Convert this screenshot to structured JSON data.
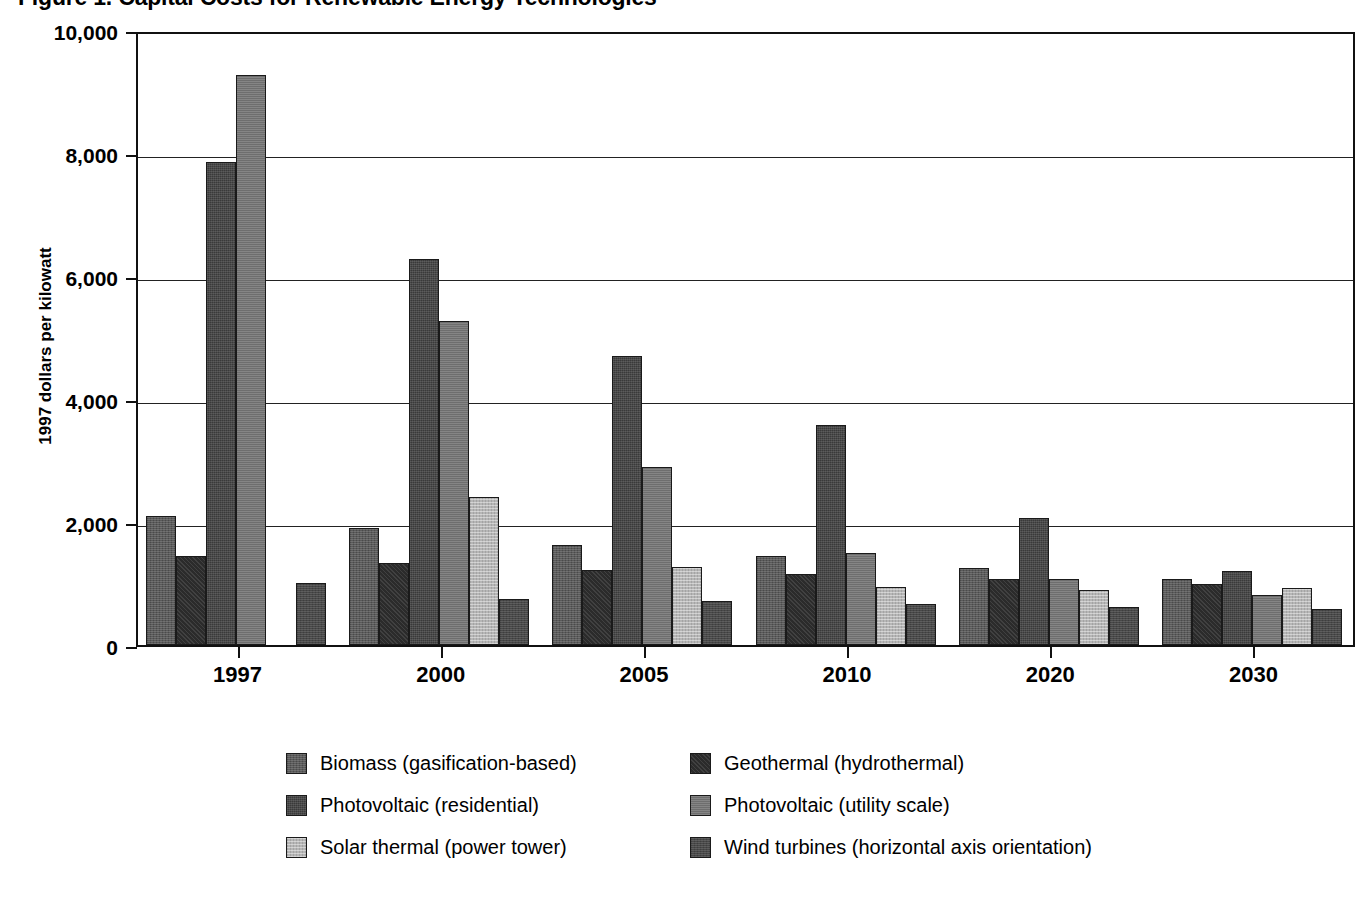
{
  "figure": {
    "title": "Figure 1.  Capital Costs for Renewable Energy Technologies",
    "y_axis_title": "1997 dollars per kilowatt"
  },
  "axis": {
    "y_ticks": [
      "10,000",
      "8,000",
      "6,000",
      "4,000",
      "2,000",
      "0"
    ],
    "x_ticks": [
      "1997",
      "2000",
      "2005",
      "2010",
      "2020",
      "2030"
    ]
  },
  "legend": {
    "items": [
      {
        "label": "Biomass (gasification-based)",
        "key": "biomass",
        "swatch": "#5a5a5a"
      },
      {
        "label": "Geothermal (hydrothermal)",
        "key": "geothermal",
        "swatch": "#2b2b2b"
      },
      {
        "label": "Photovoltaic (residential)",
        "key": "pv-res",
        "swatch": "#3a3a3a"
      },
      {
        "label": "Photovoltaic (utility scale)",
        "key": "pv-util",
        "swatch": "#6e6e6e"
      },
      {
        "label": "Solar thermal (power tower)",
        "key": "solar-thermal",
        "swatch": "#b6b6b6"
      },
      {
        "label": "Wind turbines (horizontal axis orientation)",
        "key": "wind",
        "swatch": "#484848"
      }
    ]
  },
  "chart_data": {
    "type": "bar",
    "title": "Figure 1.  Capital Costs for Renewable Energy Technologies",
    "xlabel": "",
    "ylabel": "1997 dollars per kilowatt",
    "ylim": [
      0,
      10000
    ],
    "ytick_values": [
      0,
      2000,
      4000,
      6000,
      8000,
      10000
    ],
    "grid": true,
    "legend_position": "bottom",
    "categories": [
      "1997",
      "2000",
      "2005",
      "2010",
      "2020",
      "2030"
    ],
    "series": [
      {
        "name": "Biomass (gasification-based)",
        "color": "#5a5a5a",
        "values": [
          2100,
          1900,
          1620,
          1440,
          1250,
          1070
        ]
      },
      {
        "name": "Geothermal (hydrothermal)",
        "color": "#2b2b2b",
        "values": [
          1440,
          1340,
          1220,
          1160,
          1070,
          990
        ]
      },
      {
        "name": "Photovoltaic (residential)",
        "color": "#3a3a3a",
        "values": [
          7850,
          6280,
          4700,
          3580,
          2070,
          1200
        ]
      },
      {
        "name": "Photovoltaic (utility scale)",
        "color": "#6e6e6e",
        "values": [
          9270,
          5270,
          2890,
          1500,
          1080,
          820
        ]
      },
      {
        "name": "Solar thermal (power tower)",
        "color": "#b6b6b6",
        "values": [
          null,
          2400,
          1270,
          950,
          900,
          920
        ]
      },
      {
        "name": "Wind turbines (horizontal axis orientation)",
        "color": "#484848",
        "values": [
          1010,
          750,
          710,
          660,
          620,
          590
        ]
      }
    ]
  }
}
